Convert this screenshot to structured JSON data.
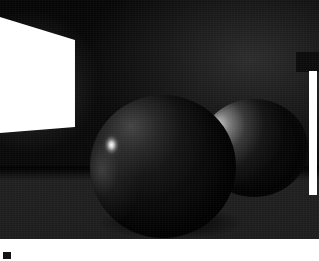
{
  "figure": {
    "caption_mark": "■",
    "plate": {
      "width": 319,
      "height": 239,
      "background_color": "#000000"
    }
  },
  "scene": {
    "description": "Dark ray-traced interior with a bright rectangular area light on the left wall, a large matte sphere in the foreground and a smaller sphere behind it, standing on a dimly lit floor.",
    "elements": [
      {
        "name": "light-panel",
        "label": "Area light panel",
        "color": "#ffffff",
        "shape": "trapezoid",
        "position": {
          "x": 0,
          "y": 17,
          "width": 75,
          "height": 116
        }
      },
      {
        "name": "edge-strip",
        "label": "Right edge light strip",
        "color": "#ffffff",
        "shape": "rectangle",
        "position": {
          "x": 309,
          "y": 71,
          "width": 8,
          "height": 124
        }
      },
      {
        "name": "sphere-front",
        "label": "Foreground sphere",
        "color": "#0c0c0c",
        "highlight_color": "#ffffff",
        "position": {
          "x": 90,
          "y": 95,
          "width": 146,
          "height": 143
        }
      },
      {
        "name": "sphere-back",
        "label": "Background sphere",
        "color": "#070707",
        "highlight_color": "#d6d6d6",
        "position": {
          "x": 200,
          "y": 99,
          "width": 108,
          "height": 98
        }
      },
      {
        "name": "floor-plane",
        "label": "Floor plane",
        "color": "#222222",
        "position": {
          "x": 0,
          "y": 168,
          "width": 319,
          "height": 71
        }
      },
      {
        "name": "wall-back",
        "label": "Back wall",
        "color": "#0a0a0a",
        "position": {
          "x": 0,
          "y": 0,
          "width": 319,
          "height": 239
        }
      }
    ]
  },
  "colors": {
    "plate_background": "#000000",
    "light_white": "#ffffff",
    "floor_gray": "#222222",
    "wall_gray": "#0a0a0a",
    "sphere_dark": "#070707",
    "caption_background": "#ffffff",
    "caption_mark": "#141414"
  }
}
